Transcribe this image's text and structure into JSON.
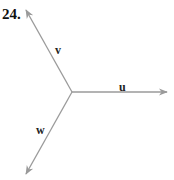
{
  "problem": {
    "number": "24."
  },
  "diagram": {
    "origin": [
      72,
      92
    ],
    "line_color": "#9a9a9a",
    "vectors": [
      {
        "name": "u",
        "label": "u",
        "tip": [
          167,
          92
        ],
        "label_pos": [
          122,
          90
        ]
      },
      {
        "name": "v",
        "label": "v",
        "tip": [
          26,
          10
        ],
        "label_pos": [
          56,
          53
        ]
      },
      {
        "name": "w",
        "label": "w",
        "tip": [
          26,
          174
        ],
        "label_pos": [
          38,
          133
        ]
      }
    ]
  }
}
